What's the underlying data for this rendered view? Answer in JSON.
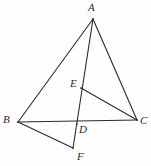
{
  "figure": {
    "kind": "geometry-diagram",
    "background_color": "#fefefe",
    "stroke_color": "#2b2b2b",
    "stroke_width": 1.1,
    "width": 151,
    "height": 166,
    "points": [
      {
        "id": "A",
        "label": "A",
        "x": 93,
        "y": 19,
        "label_x": 88,
        "label_y": 2
      },
      {
        "id": "B",
        "label": "B",
        "x": 18,
        "y": 122,
        "label_x": 3,
        "label_y": 114
      },
      {
        "id": "C",
        "label": "C",
        "x": 137,
        "y": 120,
        "label_x": 140,
        "label_y": 115
      },
      {
        "id": "D",
        "label": "D",
        "x": 77,
        "y": 124,
        "label_x": 79,
        "label_y": 124
      },
      {
        "id": "E",
        "label": "E",
        "x": 81,
        "y": 88,
        "label_x": 70,
        "label_y": 78
      },
      {
        "id": "F",
        "label": "F",
        "x": 73,
        "y": 148,
        "label_x": 77,
        "label_y": 151
      }
    ],
    "segments": [
      {
        "id": "AB",
        "from": "A",
        "to": "B"
      },
      {
        "id": "AC",
        "from": "A",
        "to": "C"
      },
      {
        "id": "AF",
        "from": "A",
        "to": "F"
      },
      {
        "id": "BC",
        "from": "B",
        "to": "C"
      },
      {
        "id": "BF",
        "from": "B",
        "to": "F"
      },
      {
        "id": "EC",
        "from": "E",
        "to": "C"
      }
    ]
  }
}
